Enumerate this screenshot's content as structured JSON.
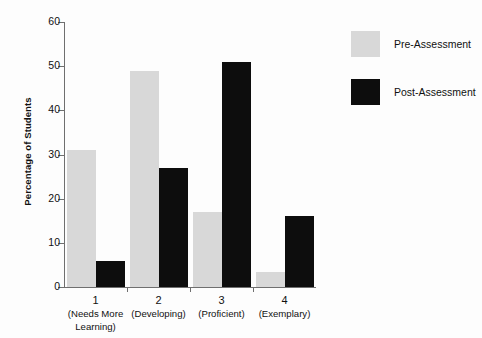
{
  "chart_data": {
    "type": "bar",
    "title": "",
    "xlabel": "",
    "ylabel": "Percentage of Students",
    "ylim": [
      0,
      60
    ],
    "yticks": [
      0,
      10,
      20,
      30,
      40,
      50,
      60
    ],
    "grid": false,
    "legend_position": "right",
    "categories": [
      "1",
      "2",
      "3",
      "4"
    ],
    "category_descriptions": [
      "(Needs More Learning)",
      "(Developing)",
      "(Proficient)",
      "(Exemplary)"
    ],
    "category_desc_lines": [
      [
        "(Needs More",
        "Learning)"
      ],
      [
        "(Developing)"
      ],
      [
        "(Proficient)"
      ],
      [
        "(Exemplary)"
      ]
    ],
    "series": [
      {
        "name": "Pre-Assessment",
        "color": "#d8d8d8",
        "values": [
          31,
          49,
          17,
          3.5
        ]
      },
      {
        "name": "Post-Assessment",
        "color": "#0d0d0d",
        "values": [
          6,
          27,
          51,
          16
        ]
      }
    ]
  },
  "colors": {
    "background": "#fdfdfd",
    "axis": "#6f6f6f",
    "text": "#111111",
    "pre_assessment": "#d8d8d8",
    "post_assessment": "#0d0d0d"
  }
}
